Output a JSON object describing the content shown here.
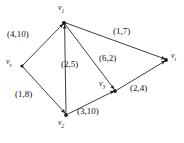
{
  "figure": {
    "type": "directed-flow-network-diagram",
    "background_color": "#ffffff",
    "ink_color": "#1a1a1a"
  },
  "nodes": [
    {
      "id": "vs",
      "label_base": "v",
      "label_sub": "s",
      "x": 22,
      "y": 66,
      "label_x": 6,
      "label_y": 58
    },
    {
      "id": "v1",
      "label_base": "v",
      "label_sub": "1",
      "x": 64,
      "y": 23,
      "label_x": 58,
      "label_y": 4
    },
    {
      "id": "v2",
      "label_base": "v",
      "label_sub": "2",
      "x": 66,
      "y": 115,
      "label_x": 58,
      "label_y": 119
    },
    {
      "id": "v3",
      "label_base": "v",
      "label_sub": "3",
      "x": 115,
      "y": 91,
      "label_x": 99,
      "label_y": 80
    },
    {
      "id": "vt",
      "label_base": "v",
      "label_sub": "t",
      "x": 166,
      "y": 60,
      "label_x": 171,
      "label_y": 52
    }
  ],
  "edges": [
    {
      "id": "vs-v1",
      "from": "vs",
      "to": "v1",
      "capacity": 4,
      "cost": 10,
      "label": "(4,10)",
      "label_x": 7,
      "label_y": 30
    },
    {
      "id": "vs-v2",
      "from": "vs",
      "to": "v2",
      "capacity": 1,
      "cost": 8,
      "label": "(1,8)",
      "label_x": 15,
      "label_y": 90
    },
    {
      "id": "v2-v1",
      "from": "v2",
      "to": "v1",
      "capacity": 2,
      "cost": 5,
      "label": "(2,5)",
      "label_x": 61,
      "label_y": 60
    },
    {
      "id": "v1-v3",
      "from": "v1",
      "to": "v3",
      "capacity": 6,
      "cost": 2,
      "label": "(6,2)",
      "label_x": 99,
      "label_y": 54
    },
    {
      "id": "v1-vt",
      "from": "v1",
      "to": "vt",
      "capacity": 1,
      "cost": 7,
      "label": "(1,7)",
      "label_x": 113,
      "label_y": 27
    },
    {
      "id": "v2-v3",
      "from": "v2",
      "to": "v3",
      "capacity": 3,
      "cost": 10,
      "label": "(3,10)",
      "label_x": 77,
      "label_y": 107
    },
    {
      "id": "v3-vt",
      "from": "v3",
      "to": "vt",
      "capacity": 2,
      "cost": 4,
      "label": "(2,4)",
      "label_x": 130,
      "label_y": 84
    }
  ]
}
